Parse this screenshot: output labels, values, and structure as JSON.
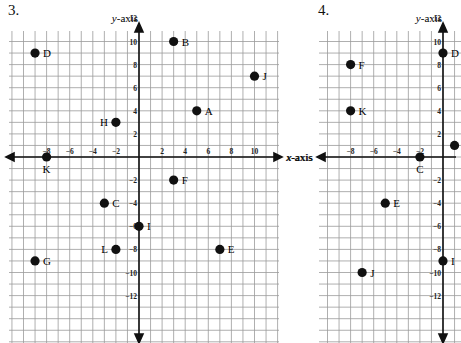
{
  "chart_data": [
    {
      "type": "scatter",
      "title": "3.",
      "xlabel": "x-axis",
      "ylabel": "y-axis",
      "grid": true,
      "xlim": [
        -11,
        12
      ],
      "ylim": [
        -13,
        13
      ],
      "x_ticks": [
        -8,
        -6,
        -4,
        -2,
        2,
        4,
        6,
        8,
        10
      ],
      "y_ticks": [
        12,
        10,
        8,
        6,
        4,
        2,
        -2,
        -4,
        -6,
        -8,
        -10,
        -12
      ],
      "points": [
        {
          "label": "A",
          "x": 5,
          "y": 4
        },
        {
          "label": "B",
          "x": 3,
          "y": 10
        },
        {
          "label": "C",
          "x": -3,
          "y": -4
        },
        {
          "label": "D",
          "x": -9,
          "y": 9
        },
        {
          "label": "E",
          "x": 7,
          "y": -8
        },
        {
          "label": "F",
          "x": 3,
          "y": -2
        },
        {
          "label": "G",
          "x": -9,
          "y": -9
        },
        {
          "label": "H",
          "x": -2,
          "y": 3
        },
        {
          "label": "I",
          "x": 0,
          "y": -6
        },
        {
          "label": "J",
          "x": 10,
          "y": 7
        },
        {
          "label": "K",
          "x": -8,
          "y": 0
        },
        {
          "label": "L",
          "x": -2,
          "y": -8
        }
      ]
    },
    {
      "type": "scatter",
      "title": "4.",
      "xlabel": "x-axis",
      "ylabel": "y-axis",
      "grid": true,
      "xlim": [
        -11,
        1
      ],
      "ylim": [
        -13,
        13
      ],
      "x_ticks": [
        -8,
        -6,
        -4,
        -2
      ],
      "y_ticks": [
        12,
        10,
        8,
        6,
        4,
        2,
        -2,
        -4,
        -6,
        -8,
        -10,
        -12
      ],
      "points": [
        {
          "label": "A",
          "x": 1,
          "y": 1
        },
        {
          "label": "C",
          "x": -2,
          "y": 0
        },
        {
          "label": "D",
          "x": 0,
          "y": 9
        },
        {
          "label": "E",
          "x": -5,
          "y": -4
        },
        {
          "label": "F",
          "x": -8,
          "y": 8
        },
        {
          "label": "I",
          "x": 0,
          "y": -9
        },
        {
          "label": "J",
          "x": -7,
          "y": -10
        },
        {
          "label": "K",
          "x": -8,
          "y": 4
        }
      ]
    }
  ],
  "problems": [
    {
      "number": "3.",
      "x_axis_label": "x-axis",
      "y_axis_label": "y-axis"
    },
    {
      "number": "4.",
      "y_axis_label": "y-axis"
    }
  ]
}
